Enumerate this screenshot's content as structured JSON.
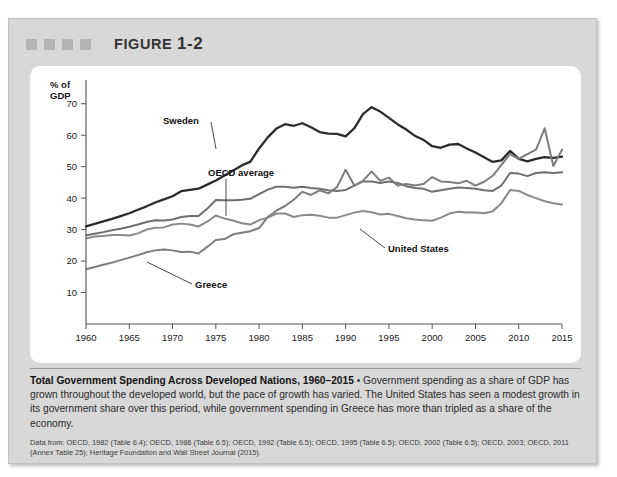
{
  "figure": {
    "label_prefix": "FIGURE",
    "number": "1-2",
    "decor_squares": 4
  },
  "caption": {
    "title": "Total Government Spending Across Developed Nations, 1960–2015",
    "separator": "•",
    "body": "Government spending as a share of GDP has grown throughout the developed world, but the pace of growth has varied. The United States has seen a modest growth in its government share over this period, while government spending in Greece has more than tripled as a share of the economy.",
    "source": "Data from: OECD, 1982 (Table 6.4); OECD, 1986 (Table 6.5); OECD, 1992 (Table 6.5); OECD, 1995 (Table 6.5); OECD, 2002 (Table 6.5); OECD, 2003; OECD, 2011 (Annex Table 25); Heritage Foundation and Wall Street Journal (2015)."
  },
  "colors": {
    "panel": "#d8d8d8",
    "card": "#ffffff",
    "sweden": "#2b2b2b",
    "oecd": "#6f6f6f",
    "united_states": "#8a8a8a",
    "greece": "#7d7d7d",
    "axis": "#555555",
    "text": "#1a1a1a"
  },
  "chart_data": {
    "type": "line",
    "title": "Total Government Spending Across Developed Nations, 1960–2015",
    "xlabel": "",
    "ylabel": "% of GDP",
    "ylabel_lines": [
      "% of",
      "GDP"
    ],
    "xlim": [
      1960,
      2015
    ],
    "ylim": [
      0,
      75
    ],
    "yticks": [
      10,
      20,
      30,
      40,
      50,
      60,
      70
    ],
    "xticks": [
      1960,
      1965,
      1970,
      1975,
      1980,
      1985,
      1990,
      1995,
      2000,
      2005,
      2010,
      2015
    ],
    "grid": false,
    "legend": "inline-annotations",
    "annotations": [
      {
        "text": "Sweden",
        "series": "Sweden"
      },
      {
        "text": "OECD average",
        "series": "OECD average"
      },
      {
        "text": "United States",
        "series": "United States"
      },
      {
        "text": "Greece",
        "series": "Greece"
      }
    ],
    "x": [
      1960,
      1961,
      1962,
      1963,
      1964,
      1965,
      1966,
      1967,
      1968,
      1969,
      1970,
      1971,
      1972,
      1973,
      1974,
      1975,
      1976,
      1977,
      1978,
      1979,
      1980,
      1981,
      1982,
      1983,
      1984,
      1985,
      1986,
      1987,
      1988,
      1989,
      1990,
      1991,
      1992,
      1993,
      1994,
      1995,
      1996,
      1997,
      1998,
      1999,
      2000,
      2001,
      2002,
      2003,
      2004,
      2005,
      2006,
      2007,
      2008,
      2009,
      2010,
      2011,
      2012,
      2013,
      2014,
      2015
    ],
    "series": [
      {
        "name": "Sweden",
        "color": "#2b2b2b",
        "values": [
          31.0,
          31.8,
          32.6,
          33.4,
          34.3,
          35.2,
          36.3,
          37.4,
          38.6,
          39.6,
          40.6,
          42.2,
          42.6,
          43.0,
          44.3,
          45.6,
          47.2,
          48.8,
          50.4,
          51.6,
          55.8,
          59.3,
          62.1,
          63.5,
          63.0,
          63.8,
          62.5,
          61.0,
          60.5,
          60.4,
          59.6,
          62.2,
          66.7,
          68.9,
          67.5,
          65.5,
          63.5,
          61.8,
          59.8,
          58.5,
          56.5,
          56.0,
          57.0,
          57.2,
          55.8,
          54.5,
          53.0,
          51.5,
          52.0,
          55.0,
          52.5,
          51.7,
          52.5,
          53.0,
          52.8,
          53.2
        ]
      },
      {
        "name": "OECD average",
        "color": "#6f6f6f",
        "values": [
          28.2,
          28.7,
          29.2,
          29.8,
          30.3,
          30.9,
          31.6,
          32.4,
          33.0,
          32.9,
          33.2,
          34.0,
          34.3,
          34.3,
          36.6,
          39.4,
          39.3,
          39.3,
          39.5,
          39.8,
          41.3,
          42.7,
          43.6,
          43.6,
          43.3,
          43.6,
          43.2,
          43.0,
          42.5,
          42.3,
          42.6,
          44.0,
          45.3,
          45.3,
          44.8,
          45.3,
          44.8,
          43.8,
          43.2,
          43.0,
          42.0,
          42.5,
          43.0,
          43.4,
          43.2,
          43.0,
          42.5,
          42.3,
          44.0,
          48.0,
          47.8,
          47.0,
          48.0,
          48.2,
          48.0,
          48.2
        ]
      },
      {
        "name": "United States",
        "color": "#8a8a8a",
        "values": [
          27.2,
          27.8,
          28.0,
          28.3,
          28.3,
          28.1,
          28.8,
          30.0,
          30.6,
          30.7,
          31.6,
          31.9,
          31.6,
          31.0,
          32.5,
          34.5,
          33.5,
          32.9,
          32.0,
          31.6,
          33.0,
          33.8,
          35.1,
          35.1,
          34.0,
          34.6,
          34.7,
          34.4,
          33.8,
          33.8,
          34.6,
          35.4,
          35.9,
          35.5,
          34.8,
          35.0,
          34.3,
          33.6,
          33.2,
          33.0,
          32.8,
          33.8,
          35.1,
          35.7,
          35.4,
          35.4,
          35.2,
          35.8,
          38.4,
          42.6,
          42.3,
          41.0,
          40.0,
          39.0,
          38.4,
          38.0
        ]
      },
      {
        "name": "Greece",
        "color": "#7d7d7d",
        "values": [
          17.4,
          18.1,
          18.8,
          19.5,
          20.3,
          21.1,
          21.9,
          22.8,
          23.4,
          23.7,
          23.4,
          22.9,
          23.0,
          22.4,
          24.5,
          26.7,
          27.0,
          28.5,
          29.0,
          29.5,
          30.5,
          34.0,
          36.0,
          37.5,
          39.5,
          42.0,
          41.0,
          42.5,
          41.5,
          43.5,
          49.0,
          44.0,
          45.5,
          48.5,
          45.5,
          46.5,
          44.0,
          44.5,
          44.0,
          44.5,
          46.7,
          45.3,
          45.1,
          44.7,
          45.5,
          44.0,
          45.2,
          47.1,
          50.6,
          54.0,
          52.5,
          54.0,
          55.4,
          62.2,
          50.2,
          55.4
        ]
      }
    ]
  }
}
